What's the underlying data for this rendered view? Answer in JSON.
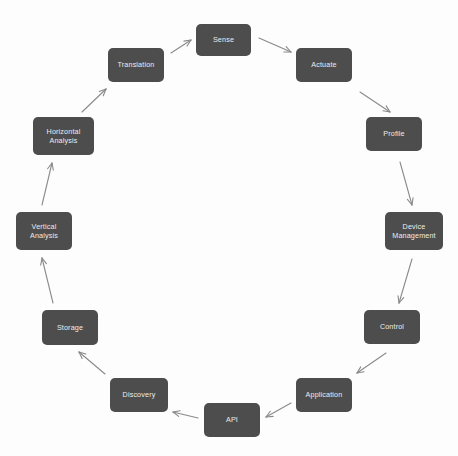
{
  "diagram": {
    "type": "cycle",
    "orientation": "clockwise",
    "background_color": "#fdfdfd",
    "node_fill_color": "#4d4d4d",
    "node_text_color": "#ececec",
    "arrow_color": "#8a8a8a",
    "node_count": 12,
    "nodes": [
      {
        "id": "sense",
        "label": "Sense",
        "x": 196,
        "y": 24,
        "w": 55,
        "h": 32
      },
      {
        "id": "actuate",
        "label": "Actuate",
        "x": 296,
        "y": 48,
        "w": 56,
        "h": 34
      },
      {
        "id": "profile",
        "label": "Profile",
        "x": 366,
        "y": 117,
        "w": 56,
        "h": 34
      },
      {
        "id": "device-management",
        "label": "Device\nManagement",
        "x": 385,
        "y": 212,
        "w": 58,
        "h": 38
      },
      {
        "id": "control",
        "label": "Control",
        "x": 364,
        "y": 310,
        "w": 56,
        "h": 34
      },
      {
        "id": "application",
        "label": "Application",
        "x": 296,
        "y": 378,
        "w": 56,
        "h": 34
      },
      {
        "id": "api",
        "label": "API",
        "x": 204,
        "y": 403,
        "w": 56,
        "h": 34
      },
      {
        "id": "discovery",
        "label": "Discovery",
        "x": 110,
        "y": 378,
        "w": 58,
        "h": 34
      },
      {
        "id": "storage",
        "label": "Storage",
        "x": 42,
        "y": 310,
        "w": 56,
        "h": 35
      },
      {
        "id": "vertical-analysis",
        "label": "Vertical\nAnalysis",
        "x": 16,
        "y": 212,
        "w": 56,
        "h": 38
      },
      {
        "id": "horizontal-analysis",
        "label": "Horizontal\nAnalysis",
        "x": 33,
        "y": 117,
        "w": 61,
        "h": 38
      },
      {
        "id": "translation",
        "label": "Translation",
        "x": 108,
        "y": 48,
        "w": 56,
        "h": 34
      }
    ],
    "edges": [
      {
        "id": "sense-to-actuate",
        "from": "sense",
        "to": "actuate",
        "x1": 259,
        "y1": 38,
        "x2": 291,
        "y2": 52
      },
      {
        "id": "actuate-to-profile",
        "from": "actuate",
        "to": "profile",
        "x1": 360,
        "y1": 92,
        "x2": 390,
        "y2": 112
      },
      {
        "id": "profile-to-device-management",
        "from": "profile",
        "to": "device-management",
        "x1": 400,
        "y1": 162,
        "x2": 412,
        "y2": 205
      },
      {
        "id": "device-management-to-control",
        "from": "device-management",
        "to": "control",
        "x1": 412,
        "y1": 259,
        "x2": 399,
        "y2": 303
      },
      {
        "id": "control-to-application",
        "from": "control",
        "to": "application",
        "x1": 386,
        "y1": 353,
        "x2": 357,
        "y2": 373
      },
      {
        "id": "application-to-api",
        "from": "application",
        "to": "api",
        "x1": 291,
        "y1": 403,
        "x2": 266,
        "y2": 417
      },
      {
        "id": "api-to-discovery",
        "from": "api",
        "to": "discovery",
        "x1": 198,
        "y1": 418,
        "x2": 173,
        "y2": 412
      },
      {
        "id": "discovery-to-storage",
        "from": "discovery",
        "to": "storage",
        "x1": 105,
        "y1": 374,
        "x2": 79,
        "y2": 352
      },
      {
        "id": "storage-to-vertical-analysis",
        "from": "storage",
        "to": "vertical-analysis",
        "x1": 53,
        "y1": 303,
        "x2": 42,
        "y2": 258
      },
      {
        "id": "vertical-to-horizontal",
        "from": "vertical-analysis",
        "to": "horizontal-analysis",
        "x1": 42,
        "y1": 205,
        "x2": 52,
        "y2": 163
      },
      {
        "id": "horizontal-to-translation",
        "from": "horizontal-analysis",
        "to": "translation",
        "x1": 82,
        "y1": 112,
        "x2": 106,
        "y2": 89
      },
      {
        "id": "translation-to-sense",
        "from": "translation",
        "to": "sense",
        "x1": 171,
        "y1": 53,
        "x2": 191,
        "y2": 40
      }
    ]
  }
}
